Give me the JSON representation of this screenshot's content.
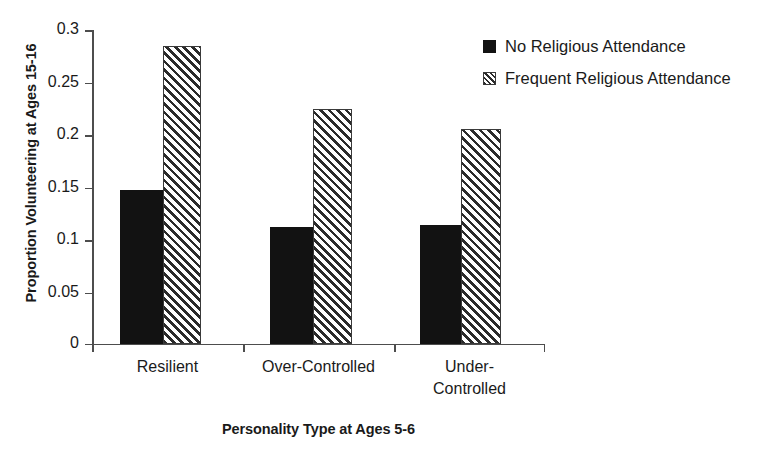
{
  "chart_data": {
    "type": "bar",
    "title": "",
    "xlabel": "Personality Type at Ages 5-6",
    "ylabel": "Proportion Volunteering at Ages 15-16",
    "categories": [
      "Resilient",
      "Over-Controlled",
      "Under-Controlled"
    ],
    "series": [
      {
        "name": "No Religious Attendance",
        "values": [
          0.146,
          0.111,
          0.113
        ],
        "fill": "solid-black",
        "color": "#121212"
      },
      {
        "name": "Frequent Religious Attendance",
        "values": [
          0.283,
          0.223,
          0.204
        ],
        "fill": "diagonal-hatch",
        "color": "#2b2b2b"
      }
    ],
    "ylim": [
      0,
      0.3
    ],
    "yticks": [
      0,
      0.05,
      0.1,
      0.15,
      0.2,
      0.25,
      0.3
    ],
    "ytick_labels": [
      "0",
      "0.05",
      "0.1",
      "0.15",
      "0.2",
      "0.25",
      "0.3"
    ],
    "grid": false,
    "legend_position": "top-right",
    "background": "#ffffff",
    "axis_color": "#4d4d4d"
  },
  "axes": {
    "y_title": "Proportion Volunteering at Ages 15-16",
    "x_title": "Personality Type at Ages 5-6",
    "y_labels": [
      "0.3",
      "0.25",
      "0.2",
      "0.15",
      "0.1",
      "0.05",
      "0"
    ]
  },
  "categories": [
    {
      "line1": "Resilient",
      "line2": ""
    },
    {
      "line1": "Over-Controlled",
      "line2": ""
    },
    {
      "line1": "Under-",
      "line2": "Controlled"
    }
  ],
  "legend": {
    "items": [
      {
        "label": "No Religious Attendance",
        "swatch": "solid-square-swatch"
      },
      {
        "label": "Frequent Religious Attendance",
        "swatch": "hatched-square-swatch"
      }
    ]
  }
}
